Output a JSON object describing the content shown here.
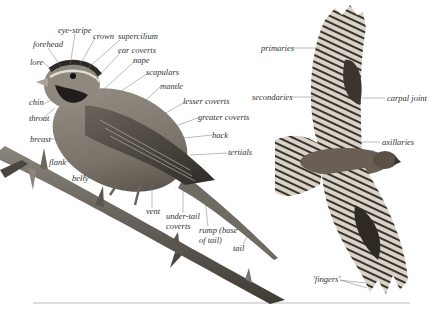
{
  "diagram": {
    "subject_left": "perched songbird with labelled plumage regions",
    "subject_right": "raptor in flight with labelled wing regions",
    "colors": {
      "label_text": "#333333",
      "leader_line": "#777777",
      "baseline": "#bbbbbb"
    }
  },
  "labels": {
    "eye_stripe": "eye-stripe",
    "crown": "crown",
    "supercilium": "supercilium",
    "forehead": "forehead",
    "ear_coverts": "ear coverts",
    "lore": "lore",
    "nape": "nape",
    "scapulars": "scapulars",
    "mantle": "mantle",
    "chin": "chin",
    "lesser_coverts": "lesser coverts",
    "throat": "throat",
    "greater_coverts": "greater coverts",
    "breast": "breast",
    "back": "back",
    "tertials": "tertials",
    "flank": "flank",
    "belly": "belly",
    "vent": "vent",
    "under_tail_coverts_1": "under-tail",
    "under_tail_coverts_2": "coverts",
    "rump_1": "rump (base",
    "rump_2": "of tail)",
    "tail": "tail",
    "primaries": "primaries",
    "secondaries": "secondaries",
    "carpal_joint": "carpal joint",
    "axillaries": "axillaries",
    "fingers": "'fingers'"
  }
}
